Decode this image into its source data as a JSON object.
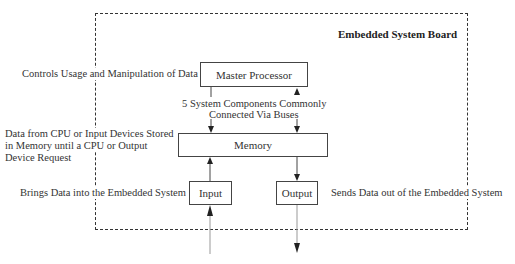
{
  "board": {
    "title": "Embedded System Board"
  },
  "components": {
    "master_processor": "Master Processor",
    "memory": "Memory",
    "input": "Input",
    "output": "Output"
  },
  "annotations": {
    "processor_desc": "Controls Usage and Manipulation of Data",
    "bus_line1": "5 System  Components Commonly",
    "bus_line2": "Connected Via  Buses",
    "memory_line1": "Data from CPU or Input Devices Stored",
    "memory_line2": "in Memory until a CPU or Output",
    "memory_line3": "Device Request",
    "input_desc": "Brings Data into the Embedded System",
    "output_desc": "Sends Data out of the Embedded System"
  },
  "colors": {
    "line": "#333333",
    "text": "#333333",
    "background": "#ffffff"
  }
}
